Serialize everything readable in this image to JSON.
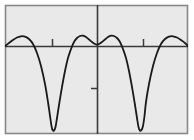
{
  "figure": {
    "name": "periodic-curve-plot",
    "width": 194,
    "height": 140,
    "background_color": "#ffffff",
    "plot_background_color": "#e9e9e9",
    "border_color": "#888888",
    "axis_color": "#3a3a3a",
    "curve_color": "#1a1a1a",
    "frame": {
      "x": 5,
      "y": 5,
      "width": 183,
      "height": 129
    }
  },
  "chart_data": {
    "type": "line",
    "title": "",
    "subtitle": "",
    "xlabel": "",
    "ylabel": "",
    "grid": false,
    "legend": null,
    "legend_position": "none",
    "xlim": [
      -4.3,
      4.3
    ],
    "ylim": [
      -2.1,
      1.25
    ],
    "origin_px": {
      "x": 97,
      "y": 46
    },
    "x_axis": {
      "label": "",
      "line_y_px": 46,
      "tick_labels": [],
      "ticks_px": [
        52,
        143
      ],
      "tick_direction": "up",
      "tick_length_px": 7
    },
    "y_axis": {
      "label": "",
      "line_x_px": 97,
      "tick_labels": [],
      "ticks_px": [
        88
      ],
      "tick_direction": "left",
      "tick_length_px": 6
    },
    "series": [
      {
        "name": "f(x)",
        "color": "#1a1a1a",
        "line_width": 1.8,
        "points_px": [
          [
            5,
            46
          ],
          [
            9,
            43
          ],
          [
            13,
            40
          ],
          [
            17,
            37.5
          ],
          [
            21,
            36.3
          ],
          [
            25,
            36.6
          ],
          [
            29,
            39
          ],
          [
            33,
            44
          ],
          [
            37,
            53
          ],
          [
            41,
            66
          ],
          [
            45,
            84
          ],
          [
            48,
            102
          ],
          [
            50,
            116
          ],
          [
            51.5,
            126
          ],
          [
            52.5,
            130
          ],
          [
            54,
            130.5
          ],
          [
            55.5,
            127
          ],
          [
            57,
            118
          ],
          [
            59,
            105
          ],
          [
            62,
            87
          ],
          [
            65,
            71
          ],
          [
            68,
            58
          ],
          [
            71,
            49
          ],
          [
            74,
            42
          ],
          [
            77,
            38
          ],
          [
            80,
            36
          ],
          [
            83,
            35.7
          ],
          [
            86,
            37
          ],
          [
            89,
            39.5
          ],
          [
            92,
            42
          ],
          [
            95,
            44
          ],
          [
            97,
            44.6
          ],
          [
            99,
            44
          ],
          [
            102,
            42
          ],
          [
            105,
            39.5
          ],
          [
            108,
            37
          ],
          [
            111,
            35.7
          ],
          [
            114,
            36
          ],
          [
            117,
            38
          ],
          [
            120,
            42
          ],
          [
            123,
            49
          ],
          [
            126,
            58
          ],
          [
            129,
            71
          ],
          [
            132,
            87
          ],
          [
            135,
            105
          ],
          [
            137,
            118
          ],
          [
            138.5,
            127
          ],
          [
            140,
            130.5
          ],
          [
            141.5,
            130
          ],
          [
            143,
            126
          ],
          [
            144.5,
            116
          ],
          [
            146,
            102
          ],
          [
            149,
            84
          ],
          [
            153,
            66
          ],
          [
            157,
            53
          ],
          [
            161,
            44
          ],
          [
            165,
            39
          ],
          [
            169,
            36.6
          ],
          [
            173,
            36.3
          ],
          [
            177,
            37.5
          ],
          [
            181,
            40
          ],
          [
            185,
            43
          ],
          [
            188,
            46
          ]
        ],
        "description": "smooth periodic wave with broad shallow maxima near the axis and two deep narrow minima"
      }
    ]
  }
}
